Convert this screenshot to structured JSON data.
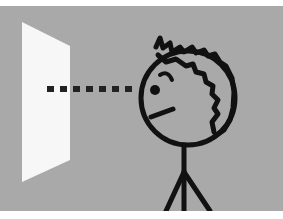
{
  "illustration": {
    "description": "Stick figure with curly hair looking at a white panel along a dotted line of sight",
    "colors": {
      "background": "#a9a9a9",
      "frame": "#ffffff",
      "panel": "#f7f7f7",
      "ink": "#111111"
    },
    "elements": {
      "panel": "white-panel",
      "sight_line": "dotted-sight-line",
      "figure": "stick-figure"
    }
  }
}
